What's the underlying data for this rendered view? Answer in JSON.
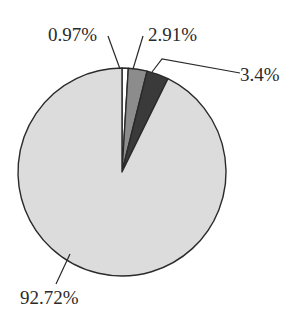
{
  "chart_data": {
    "type": "pie",
    "title": "",
    "categories": [
      "Slice A",
      "Slice B",
      "Slice C",
      "Slice D"
    ],
    "values": [
      0.97,
      2.91,
      3.4,
      92.72
    ],
    "labels": [
      "0.97%",
      "2.91%",
      "3.4%",
      "92.72%"
    ],
    "colors": [
      "#ffffff",
      "#8c8c8c",
      "#3a3a3a",
      "#dcdcdc"
    ],
    "start_angle_deg": 0,
    "direction": "clockwise",
    "legend": "none",
    "label_style": "outside with leader lines"
  },
  "colors": {
    "outline": "#2a2a2a",
    "background": "#ffffff"
  }
}
